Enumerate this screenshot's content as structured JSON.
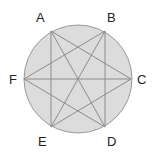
{
  "diagram": {
    "circle": {
      "cx": 78,
      "cy": 79,
      "r": 54,
      "fill": "#dcdcdc",
      "stroke": "#9a9a9a"
    },
    "line_color": "#8c8c8c",
    "points": [
      {
        "id": "A",
        "label": "A",
        "x": 51,
        "y": 31,
        "lx": 36,
        "ly": 22
      },
      {
        "id": "B",
        "label": "B",
        "x": 105,
        "y": 31,
        "lx": 107,
        "ly": 22
      },
      {
        "id": "C",
        "label": "C",
        "x": 131,
        "y": 79,
        "lx": 137,
        "ly": 84
      },
      {
        "id": "D",
        "label": "D",
        "x": 105,
        "y": 127,
        "lx": 107,
        "ly": 146
      },
      {
        "id": "E",
        "label": "E",
        "x": 51,
        "y": 127,
        "lx": 38,
        "ly": 146
      },
      {
        "id": "F",
        "label": "F",
        "x": 24,
        "y": 79,
        "lx": 9,
        "ly": 84
      }
    ],
    "segments": [
      [
        "A",
        "E"
      ],
      [
        "B",
        "D"
      ],
      [
        "F",
        "C"
      ],
      [
        "A",
        "C"
      ],
      [
        "A",
        "D"
      ],
      [
        "B",
        "F"
      ],
      [
        "B",
        "E"
      ],
      [
        "F",
        "D"
      ],
      [
        "E",
        "C"
      ]
    ]
  }
}
